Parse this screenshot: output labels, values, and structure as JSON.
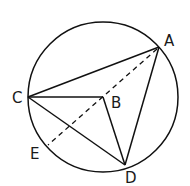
{
  "diagram": {
    "type": "circle-geometry",
    "circle": {
      "cx": 103,
      "cy": 97,
      "r": 75
    },
    "points": {
      "A": {
        "label": "A",
        "x": 159,
        "y": 47
      },
      "B": {
        "label": "B",
        "x": 103,
        "y": 97
      },
      "C": {
        "label": "C",
        "x": 28,
        "y": 97
      },
      "D": {
        "label": "D",
        "x": 125,
        "y": 165
      },
      "E": {
        "label": "E",
        "x": 48,
        "y": 145
      }
    },
    "segments_solid": [
      "CA",
      "AD",
      "CD",
      "CB",
      "BD"
    ],
    "segments_dashed": [
      "AE"
    ],
    "colors": {
      "line": "#111111",
      "background": "#ffffff"
    }
  }
}
